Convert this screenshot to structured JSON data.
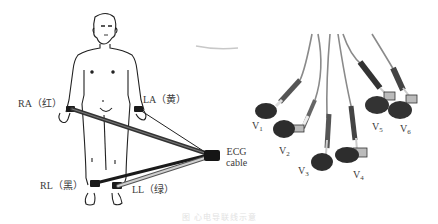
{
  "figure": {
    "limb_leads": [
      {
        "id": "RA",
        "label": "RA（红）",
        "color_name": "红"
      },
      {
        "id": "LA",
        "label": "LA（黄）",
        "color_name": "黄"
      },
      {
        "id": "RL",
        "label": "RL（黑）",
        "color_name": "黑"
      },
      {
        "id": "LL",
        "label": "LL（绿）",
        "color_name": "绿"
      }
    ],
    "cable_label": {
      "line1": "ECG",
      "line2": "cable"
    },
    "chest_leads": [
      {
        "base": "V",
        "sub": "1"
      },
      {
        "base": "V",
        "sub": "2"
      },
      {
        "base": "V",
        "sub": "3"
      },
      {
        "base": "V",
        "sub": "4"
      },
      {
        "base": "V",
        "sub": "5"
      },
      {
        "base": "V",
        "sub": "6"
      }
    ],
    "caption": "图 心电导联线示意"
  }
}
